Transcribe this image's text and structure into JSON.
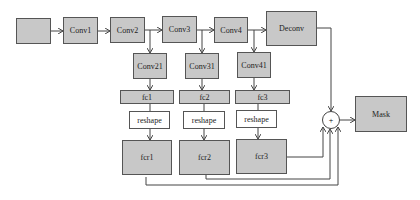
{
  "diagram": {
    "nodes": {
      "input": "",
      "conv1": "Conv1",
      "conv2": "Conv2",
      "conv3": "Conv3",
      "conv4": "Conv4",
      "deconv": "Deconv",
      "conv21": "Conv21",
      "conv31": "Conv31",
      "conv41": "Conv41",
      "fc1": "fc1",
      "fc2": "fc2",
      "fc3": "fc3",
      "reshape1": "reshape",
      "reshape2": "reshape",
      "reshape3": "reshape",
      "fcr1": "fcr1",
      "fcr2": "fcr2",
      "fcr3": "fcr3",
      "sum": "+",
      "mask": "Mask"
    },
    "colors": {
      "fill": "#c8c8c8",
      "stroke": "#555555"
    }
  }
}
